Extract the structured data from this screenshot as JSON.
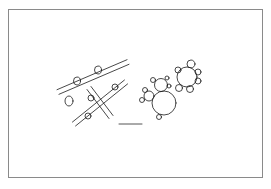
{
  "figure": {
    "colors": {
      "background": "#ffffff",
      "frame": "#8a8a8a",
      "ink": "#1a1a1a"
    },
    "frame": {
      "x": 8,
      "y": 9,
      "width": 255,
      "height": 169
    },
    "tubes": [
      {
        "name": "upper-tube",
        "from": [
          58,
          92
        ],
        "to": [
          128,
          62
        ],
        "width": 5
      },
      {
        "name": "lower-tube",
        "from": [
          74,
          124
        ],
        "to": [
          126,
          82
        ],
        "width": 5
      },
      {
        "name": "connector-tube",
        "from": [
          89,
          88
        ],
        "to": [
          111,
          117
        ],
        "width": 5
      }
    ],
    "buds": [
      {
        "cx": 69,
        "cy": 101,
        "rx": 4,
        "ry": 5
      },
      {
        "cx": 77,
        "cy": 81,
        "rx": 3.5,
        "ry": 4
      },
      {
        "cx": 98,
        "cy": 70,
        "rx": 3.5,
        "ry": 4
      },
      {
        "cx": 91,
        "cy": 98,
        "rx": 3,
        "ry": 3
      },
      {
        "cx": 115,
        "cy": 87,
        "rx": 3,
        "ry": 3
      },
      {
        "cx": 88,
        "cy": 116,
        "rx": 3,
        "ry": 3
      }
    ],
    "circle_clusters": [
      {
        "name": "left-cluster",
        "circles": [
          {
            "cx": 164,
            "cy": 103,
            "r": 12
          },
          {
            "cx": 161,
            "cy": 85,
            "r": 6.5
          },
          {
            "cx": 149,
            "cy": 96,
            "r": 5
          },
          {
            "cx": 142,
            "cy": 100,
            "r": 2.5
          },
          {
            "cx": 145,
            "cy": 90,
            "r": 2.5
          },
          {
            "cx": 153,
            "cy": 80,
            "r": 2.5
          },
          {
            "cx": 167,
            "cy": 78,
            "r": 2
          },
          {
            "cx": 169,
            "cy": 86,
            "r": 2
          },
          {
            "cx": 159,
            "cy": 117,
            "r": 2.5
          }
        ]
      },
      {
        "name": "right-cluster",
        "circles": [
          {
            "cx": 187,
            "cy": 77,
            "r": 10
          },
          {
            "cx": 191,
            "cy": 64,
            "r": 4
          },
          {
            "cx": 178,
            "cy": 70,
            "r": 3
          },
          {
            "cx": 198,
            "cy": 72,
            "r": 3
          },
          {
            "cx": 198,
            "cy": 81,
            "r": 3
          },
          {
            "cx": 190,
            "cy": 89,
            "r": 3.5
          },
          {
            "cx": 179,
            "cy": 88,
            "r": 3.5
          }
        ]
      }
    ],
    "scale_bar": {
      "x1": 119,
      "x2": 142,
      "y": 124
    }
  }
}
